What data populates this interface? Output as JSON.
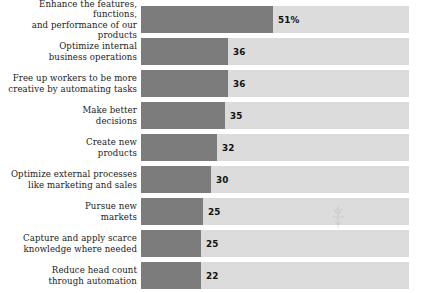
{
  "chart_data": {
    "type": "bar",
    "orientation": "horizontal",
    "title": "",
    "subtitle": "",
    "xlabel": "",
    "ylabel": "",
    "xlim": [
      0,
      100
    ],
    "grid": false,
    "legend": null,
    "value_suffix": "",
    "categories": [
      "Enhance the features, functions,\nand performance of our products",
      "Optimize internal\nbusiness operations",
      "Free up workers to be more\ncreative by automating tasks",
      "Make better\ndecisions",
      "Create new\nproducts",
      "Optimize external processes\nlike marketing and sales",
      "Pursue new\nmarkets",
      "Capture and apply scarce\nknowledge where needed",
      "Reduce head count\nthrough automation"
    ],
    "values": [
      51,
      36,
      36,
      35,
      32,
      30,
      25,
      25,
      22
    ],
    "value_labels": [
      "51%",
      "36",
      "36",
      "35",
      "32",
      "30",
      "25",
      "25",
      "22"
    ],
    "colors": {
      "bar_fill": "#7c7c7c",
      "bar_track": "#dcdcdc",
      "label_text": "#1b1b1b",
      "value_text": "#111111",
      "background": "#ffffff"
    }
  },
  "bars": [
    {
      "label": "Enhance the features, functions,\nand performance of our products",
      "value": 51,
      "value_label": "51%",
      "fill_px": 132
    },
    {
      "label": "Optimize internal\nbusiness operations",
      "value": 36,
      "value_label": "36",
      "fill_px": 87
    },
    {
      "label": "Free up workers to be more\ncreative by automating tasks",
      "value": 36,
      "value_label": "36",
      "fill_px": 87
    },
    {
      "label": "Make better\ndecisions",
      "value": 35,
      "value_label": "35",
      "fill_px": 84
    },
    {
      "label": "Create new\nproducts",
      "value": 32,
      "value_label": "32",
      "fill_px": 76
    },
    {
      "label": "Optimize external processes\nlike marketing and sales",
      "value": 30,
      "value_label": "30",
      "fill_px": 70
    },
    {
      "label": "Pursue new\nmarkets",
      "value": 25,
      "value_label": "25",
      "fill_px": 62
    },
    {
      "label": "Capture and apply scarce\nknowledge where needed",
      "value": 25,
      "value_label": "25",
      "fill_px": 60
    },
    {
      "label": "Reduce head count\nthrough automation",
      "value": 22,
      "value_label": "22",
      "fill_px": 60
    }
  ]
}
